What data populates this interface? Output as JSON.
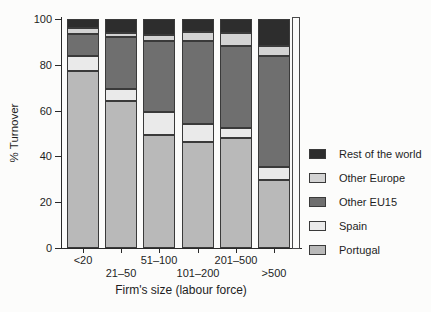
{
  "chart_data": {
    "type": "bar",
    "stacked": true,
    "title": "",
    "xlabel": "Firm's size (labour force)",
    "ylabel": "% Turnover",
    "ylim": [
      0,
      100
    ],
    "yticks": [
      0,
      20,
      40,
      60,
      80,
      100
    ],
    "grid": false,
    "legend_position": "right",
    "categories": [
      "<20",
      "21–50",
      "51–100",
      "101–200",
      "201–500",
      ">500"
    ],
    "series": [
      {
        "name": "Portugal",
        "color": "#b9b9b9",
        "values": [
          77.5,
          64.0,
          49.5,
          46.5,
          48.0,
          29.5
        ]
      },
      {
        "name": "Spain",
        "color": "#eaeaea",
        "values": [
          6.5,
          5.5,
          10.0,
          7.5,
          4.5,
          6.0
        ]
      },
      {
        "name": "Other EU15",
        "color": "#6f6f6f",
        "values": [
          9.5,
          22.5,
          31.0,
          36.5,
          35.5,
          48.5
        ]
      },
      {
        "name": "Other Europe",
        "color": "#d3d3d3",
        "values": [
          2.5,
          2.0,
          2.5,
          4.0,
          6.0,
          4.0
        ]
      },
      {
        "name": "Rest of the world",
        "color": "#2d2d2d",
        "values": [
          4.0,
          6.0,
          7.0,
          5.5,
          6.0,
          12.0
        ]
      }
    ],
    "legend": [
      "Rest of the world",
      "Other Europe",
      "Other EU15",
      "Spain",
      "Portugal"
    ]
  }
}
